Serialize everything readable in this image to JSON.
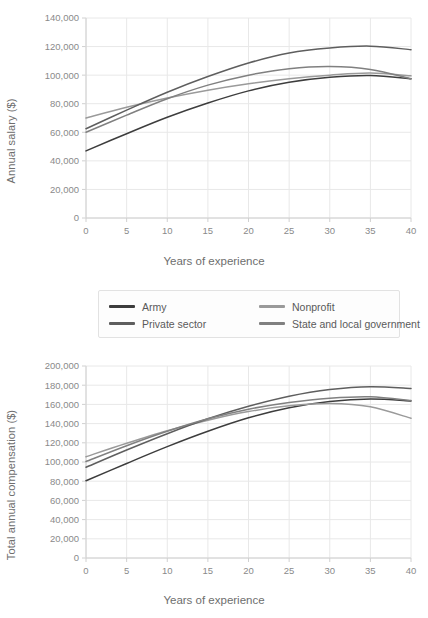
{
  "figure": {
    "background": "#ffffff",
    "grid_color": "#e8e8e8",
    "axis_color": "#d0d0d0",
    "tick_text_color": "#8a8a8a"
  },
  "legend": {
    "position": "between-charts",
    "entries": [
      {
        "label": "Army",
        "color": "#3d3d3d",
        "swatch": "line-swatch"
      },
      {
        "label": "Nonprofit",
        "color": "#9a9a9a",
        "swatch": "line-swatch"
      },
      {
        "label": "Private sector",
        "color": "#5e5e5e",
        "swatch": "line-swatch"
      },
      {
        "label": "State and local government",
        "color": "#808080",
        "swatch": "line-swatch"
      }
    ]
  },
  "chart_data": [
    {
      "id": "annual-salary",
      "type": "line",
      "title": "",
      "xlabel": "Years of experience",
      "ylabel": "Annual salary ($)",
      "xlim": [
        0,
        40
      ],
      "ylim": [
        0,
        140000
      ],
      "xticks": [
        0,
        5,
        10,
        15,
        20,
        25,
        30,
        35,
        40
      ],
      "xticklabels": [
        "0",
        "5",
        "10",
        "15",
        "20",
        "25",
        "30",
        "35",
        "40"
      ],
      "yticks": [
        0,
        20000,
        40000,
        60000,
        80000,
        100000,
        120000,
        140000
      ],
      "yticklabels": [
        "0",
        "20,000",
        "40,000",
        "60,000",
        "80,000",
        "100,000",
        "120,000",
        "140,000"
      ],
      "grid": true,
      "legend_position": "outside-below",
      "x": [
        0,
        5,
        10,
        15,
        20,
        25,
        30,
        35,
        40
      ],
      "series": [
        {
          "name": "Army",
          "color": "#3d3d3d",
          "values": [
            47000,
            59000,
            70500,
            80500,
            89000,
            95000,
            98500,
            99800,
            97500
          ]
        },
        {
          "name": "Nonprofit",
          "color": "#9a9a9a",
          "values": [
            70000,
            77500,
            84000,
            89500,
            94000,
            97500,
            100000,
            101500,
            99500
          ]
        },
        {
          "name": "Private sector",
          "color": "#5e5e5e",
          "values": [
            62500,
            75500,
            88000,
            99000,
            108500,
            115500,
            119000,
            120300,
            117800
          ]
        },
        {
          "name": "State and local government",
          "color": "#808080",
          "values": [
            60000,
            72000,
            83500,
            93000,
            100000,
            104500,
            106000,
            104000,
            97500
          ]
        }
      ]
    },
    {
      "id": "total-annual-compensation",
      "type": "line",
      "title": "",
      "xlabel": "Years of experience",
      "ylabel": "Total annual compensation ($)",
      "xlim": [
        0,
        40
      ],
      "ylim": [
        0,
        200000
      ],
      "xticks": [
        0,
        5,
        10,
        15,
        20,
        25,
        30,
        35,
        40
      ],
      "xticklabels": [
        "0",
        "5",
        "10",
        "15",
        "20",
        "25",
        "30",
        "35",
        "40"
      ],
      "yticks": [
        0,
        20000,
        40000,
        60000,
        80000,
        100000,
        120000,
        140000,
        160000,
        180000,
        200000
      ],
      "yticklabels": [
        "0",
        "20,000",
        "40,000",
        "60,000",
        "80,000",
        "100,000",
        "120,000",
        "140,000",
        "160,000",
        "180,000",
        "200,000"
      ],
      "grid": true,
      "legend_position": "outside-above",
      "x": [
        0,
        5,
        10,
        15,
        20,
        25,
        30,
        35,
        40
      ],
      "series": [
        {
          "name": "Army",
          "color": "#3d3d3d",
          "values": [
            80500,
            98500,
            116000,
            132000,
            146000,
            156500,
            163000,
            165500,
            163500
          ]
        },
        {
          "name": "Nonprofit",
          "color": "#9a9a9a",
          "values": [
            105500,
            119500,
            132500,
            143500,
            152500,
            158500,
            161000,
            157500,
            145500
          ]
        },
        {
          "name": "Private sector",
          "color": "#5e5e5e",
          "values": [
            94500,
            112500,
            129500,
            145000,
            158000,
            168500,
            175500,
            178500,
            176500
          ]
        },
        {
          "name": "State and local government",
          "color": "#808080",
          "values": [
            100500,
            117000,
            132000,
            145000,
            155000,
            162000,
            166500,
            168000,
            164000
          ]
        }
      ]
    }
  ]
}
